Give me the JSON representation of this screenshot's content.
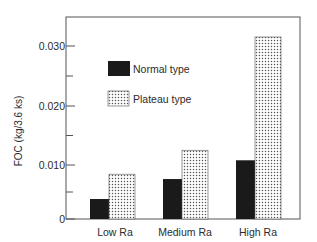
{
  "chart_data": {
    "type": "bar",
    "title": "",
    "xlabel": "",
    "ylabel": "FOC (kg/3.6 ks)",
    "categories": [
      "Low Ra",
      "Medium Ra",
      "High Ra"
    ],
    "series": [
      {
        "name": "Normal type",
        "values": [
          0.0037,
          0.0074,
          0.0108
        ],
        "fill": "solid",
        "color": "#1a1a1a"
      },
      {
        "name": "Plateau type",
        "values": [
          0.0083,
          0.0125,
          0.0315
        ],
        "fill": "dotted",
        "color": "#ffffff"
      }
    ],
    "ylim": [
      0,
      0.035
    ],
    "yticks": [
      {
        "value": 0,
        "label": "0"
      },
      {
        "value": 0.01,
        "label": "0.010"
      },
      {
        "value": 0.02,
        "label": "0.020"
      },
      {
        "value": 0.03,
        "label": "0.030"
      }
    ],
    "minor_yticks": [
      0.005,
      0.015,
      0.025
    ],
    "grid": false,
    "legend_position": "upper-left inside"
  },
  "colors": {
    "axis": "#555555",
    "text": "#2b2b2b",
    "normal_fill": "#1a1a1a",
    "plateau_dot": "#555555"
  }
}
